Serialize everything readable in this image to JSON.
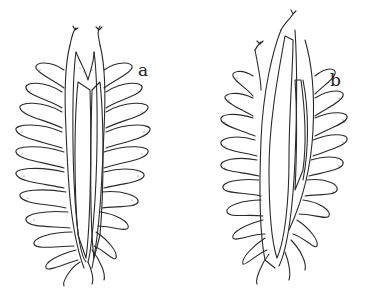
{
  "figure": {
    "panels": [
      {
        "id": "a",
        "label": "a",
        "description": "symmetric gill with two striated lamellae and curled filaments"
      },
      {
        "id": "b",
        "label": "b",
        "description": "asymmetric gill with one lamella extended upward"
      }
    ],
    "colors": {
      "background": "#ffffff",
      "ink": "#2a2a2a"
    }
  }
}
